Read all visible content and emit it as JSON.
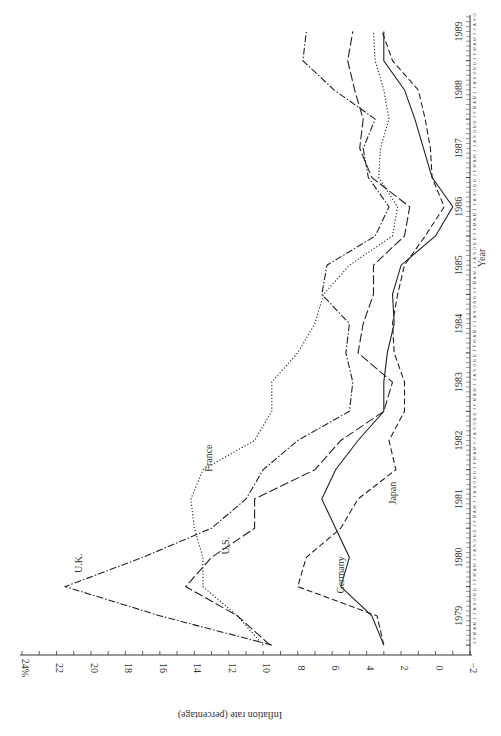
{
  "chart_data": {
    "type": "line",
    "orientation": "rotated-90-ccw",
    "title": "",
    "xlabel": "Year",
    "ylabel": "Inflation rate (percentage)",
    "ylim": [
      -2,
      24
    ],
    "yticks": [
      "24%",
      "22",
      "20",
      "18",
      "16",
      "14",
      "12",
      "10",
      "8",
      "6",
      "4",
      "2",
      "0",
      "−2"
    ],
    "xticks": [
      "1979",
      "1980",
      "1981",
      "1982",
      "1983",
      "1984",
      "1985",
      "1986",
      "1987",
      "1988",
      "1989"
    ],
    "month_ticks": "J F M A M J J A S O N D",
    "grid": false,
    "legend": "inline labels",
    "x": [
      1979.0,
      1979.5,
      1980.0,
      1980.5,
      1981.0,
      1981.5,
      1982.0,
      1982.5,
      1983.0,
      1983.5,
      1984.0,
      1984.5,
      1985.0,
      1985.5,
      1986.0,
      1986.5,
      1987.0,
      1987.5,
      1988.0,
      1988.5,
      1989.0,
      1989.5
    ],
    "series": [
      {
        "name": "U.K.",
        "style": "dash-dot",
        "label_pos": [
          1980.4,
          20.5
        ],
        "values": [
          9.5,
          16,
          21.5,
          17,
          13,
          11,
          10,
          8,
          5,
          4.8,
          5.2,
          5.0,
          6.6,
          6.3,
          3.5,
          2.7,
          3.9,
          4.2,
          3.5,
          5.9,
          7.7,
          7.5
        ]
      },
      {
        "name": "U.S.",
        "style": "long-dash",
        "label_pos": [
          1980.7,
          12
        ],
        "values": [
          9.6,
          11.5,
          14.5,
          13.0,
          10.5,
          10.5,
          7.0,
          5.5,
          3.0,
          2.5,
          4.5,
          4.2,
          3.6,
          3.6,
          1.8,
          1.5,
          3.7,
          4.4,
          4.2,
          4.7,
          5.1,
          4.8
        ]
      },
      {
        "name": "France",
        "style": "dotted",
        "label_pos": [
          1982.2,
          13.0
        ],
        "values": [
          10.0,
          11.5,
          13.5,
          13.5,
          14.0,
          14.2,
          13.5,
          10.5,
          9.5,
          9.5,
          8.0,
          7.0,
          6.5,
          5.0,
          2.5,
          2.2,
          3.3,
          3.2,
          2.7,
          3.0,
          3.5,
          3.6
        ]
      },
      {
        "name": "Germany",
        "style": "solid",
        "label_pos": [
          1980.2,
          5.3
        ],
        "values": [
          3.0,
          3.7,
          5.5,
          5.0,
          5.8,
          6.6,
          5.8,
          4.5,
          3.0,
          3.0,
          2.8,
          2.4,
          2.5,
          2.0,
          0.0,
          -1.0,
          0.2,
          0.7,
          1.2,
          1.8,
          3.0,
          3.0
        ]
      },
      {
        "name": "Japan",
        "style": "dashed",
        "label_pos": [
          1981.6,
          2.3
        ],
        "values": [
          3.0,
          3.4,
          8.0,
          7.5,
          5.5,
          4.5,
          2.3,
          2.7,
          1.8,
          1.8,
          2.4,
          2.5,
          2.2,
          1.8,
          0.6,
          -0.5,
          0.2,
          0.3,
          0.6,
          1.0,
          2.5,
          3.1
        ]
      }
    ]
  },
  "axes": {
    "x_label": "Year",
    "y_label": "Inflation rate (percentage)"
  }
}
